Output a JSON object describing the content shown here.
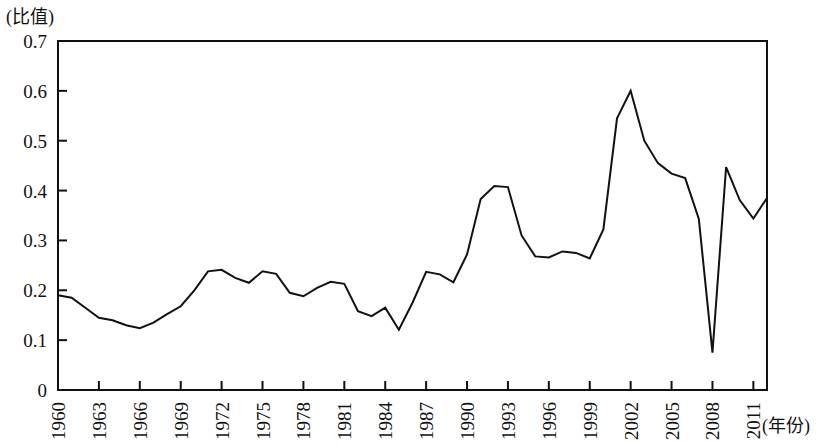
{
  "chart_data": {
    "type": "line",
    "title": "",
    "xlabel": "(年份)",
    "ylabel": "(比值)",
    "ylim": [
      0,
      0.7
    ],
    "xlim": [
      1960,
      2012
    ],
    "grid": false,
    "legend": "none",
    "ytick_labels": [
      "0.7",
      "0.6",
      "0.5",
      "0.4",
      "0.3",
      "0.2",
      "0.1",
      "0"
    ],
    "ytick_values": [
      0.7,
      0.6,
      0.5,
      0.4,
      0.3,
      0.2,
      0.1,
      0
    ],
    "xtick_labels": [
      "1960",
      "1963",
      "1966",
      "1969",
      "1972",
      "1975",
      "1978",
      "1981",
      "1984",
      "1987",
      "1990",
      "1993",
      "1996",
      "1999",
      "2002",
      "2005",
      "2008",
      "2011"
    ],
    "xtick_values": [
      1960,
      1963,
      1966,
      1969,
      1972,
      1975,
      1978,
      1981,
      1984,
      1987,
      1990,
      1993,
      1996,
      1999,
      2002,
      2005,
      2008,
      2011
    ],
    "line_color": "#111111",
    "x": [
      1960,
      1961,
      1962,
      1963,
      1964,
      1965,
      1966,
      1967,
      1968,
      1969,
      1970,
      1971,
      1972,
      1973,
      1974,
      1975,
      1976,
      1977,
      1978,
      1979,
      1980,
      1981,
      1982,
      1983,
      1984,
      1985,
      1986,
      1987,
      1988,
      1989,
      1990,
      1991,
      1992,
      1993,
      1994,
      1995,
      1996,
      1997,
      1998,
      1999,
      2000,
      2001,
      2002,
      2003,
      2004,
      2005,
      2006,
      2007,
      2008,
      2009,
      2010,
      2011,
      2012
    ],
    "values": [
      0.19,
      0.185,
      0.165,
      0.145,
      0.14,
      0.13,
      0.124,
      0.135,
      0.152,
      0.168,
      0.2,
      0.238,
      0.241,
      0.225,
      0.215,
      0.238,
      0.233,
      0.195,
      0.188,
      0.205,
      0.217,
      0.213,
      0.158,
      0.148,
      0.165,
      0.121,
      0.175,
      0.237,
      0.232,
      0.216,
      0.272,
      0.383,
      0.409,
      0.407,
      0.31,
      0.268,
      0.266,
      0.278,
      0.275,
      0.264,
      0.322,
      0.545,
      0.6,
      0.5,
      0.455,
      0.434,
      0.425,
      0.343,
      0.075,
      0.447,
      0.381,
      0.344,
      0.385
    ],
    "series": [
      {
        "name": "比值",
        "values": [
          0.19,
          0.185,
          0.165,
          0.145,
          0.14,
          0.13,
          0.124,
          0.135,
          0.152,
          0.168,
          0.2,
          0.238,
          0.241,
          0.225,
          0.215,
          0.238,
          0.233,
          0.195,
          0.188,
          0.205,
          0.217,
          0.213,
          0.158,
          0.148,
          0.165,
          0.121,
          0.175,
          0.237,
          0.232,
          0.216,
          0.272,
          0.383,
          0.409,
          0.407,
          0.31,
          0.268,
          0.266,
          0.278,
          0.275,
          0.264,
          0.322,
          0.545,
          0.6,
          0.5,
          0.455,
          0.434,
          0.425,
          0.343,
          0.075,
          0.447,
          0.381,
          0.344,
          0.385
        ]
      }
    ]
  }
}
